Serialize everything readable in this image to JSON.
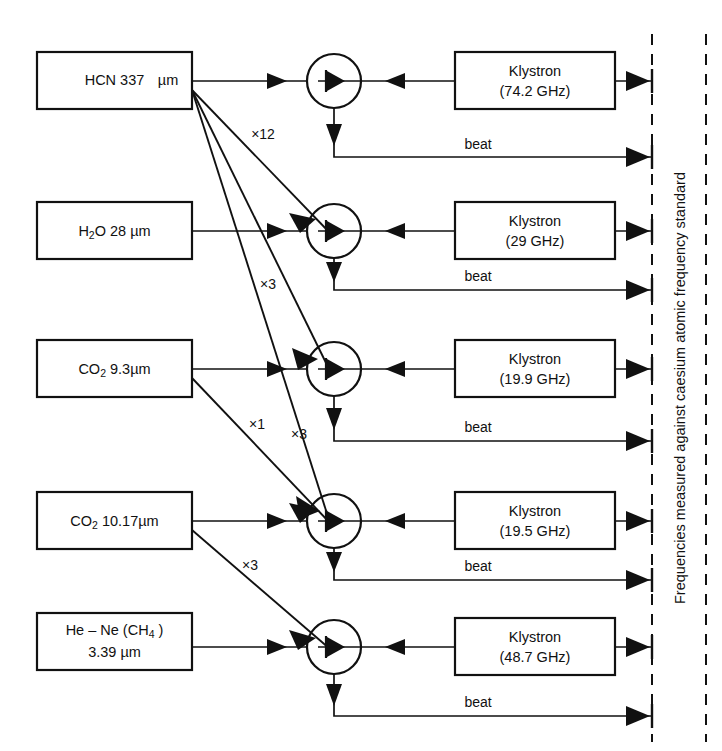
{
  "diagram": {
    "title_side": "Frequencies measured against caesium atomic frequency standard",
    "beat_label": "beat",
    "klystron_word": "Klystron",
    "rows": [
      {
        "source_main": "HCN 337",
        "source_unit": "µm",
        "source_sub": "",
        "source_tail": "",
        "klystron_freq": "(74.2 GHz)",
        "beat": "beat"
      },
      {
        "source_main": "H",
        "source_sub": "2",
        "source_tail": "O  28 ",
        "source_unit": "µm",
        "klystron_freq": "(29 GHz)",
        "beat": "beat"
      },
      {
        "source_main": "CO",
        "source_sub": "2",
        "source_tail": "  9.3",
        "source_unit": "µm",
        "klystron_freq": "(19.9 GHz)",
        "beat": "beat"
      },
      {
        "source_main": "CO",
        "source_sub": "2",
        "source_tail": "  10.17",
        "source_unit": "µm",
        "klystron_freq": "(19.5 GHz)",
        "beat": "beat"
      },
      {
        "source_main": "He – Ne (CH",
        "source_sub": "4",
        "source_tail": " )",
        "source_line2": "3.39 µm",
        "source_unit": "",
        "klystron_freq": "(48.7 GHz)",
        "beat": "beat"
      }
    ],
    "multipliers": [
      {
        "label": "×12",
        "from_row": 1,
        "to_row": 2
      },
      {
        "label": "×3",
        "from_row": 1,
        "to_row": 3
      },
      {
        "label": "×3",
        "from_row": 1,
        "to_row": 4
      },
      {
        "label": "×1",
        "from_row": 3,
        "to_row": 4
      },
      {
        "label": "×3",
        "from_row": 4,
        "to_row": 5
      }
    ],
    "colors": {
      "ink": "#111111",
      "paper": "#ffffff"
    }
  }
}
